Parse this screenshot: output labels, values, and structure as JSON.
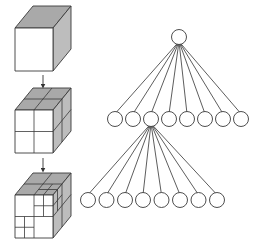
{
  "diagram": {
    "colors": {
      "stroke": "#3a3a3a",
      "front_face": "#ffffff",
      "top_face": "#a9a9a9",
      "side_face": "#bdbdbd",
      "node_fill": "#ffffff",
      "edge": "#333333",
      "background": "#ffffff"
    },
    "cubes": [
      {
        "level": 0,
        "label": "root cube",
        "front": {
          "x": 15,
          "y": 28,
          "w": 38,
          "h": 43
        },
        "depth": {
          "dx": 18,
          "dy": -22
        },
        "subdivision": "none"
      },
      {
        "level": 1,
        "label": "cube split into 8 octants",
        "front": {
          "x": 15,
          "y": 110,
          "w": 38,
          "h": 43
        },
        "depth": {
          "dx": 18,
          "dy": -22
        },
        "subdivision": "2x2x2"
      },
      {
        "level": 2,
        "label": "adaptively refined octree",
        "front": {
          "x": 15,
          "y": 195,
          "w": 38,
          "h": 43
        },
        "depth": {
          "dx": 18,
          "dy": -22
        },
        "subdivision": "2x2x2 with refined octants"
      }
    ],
    "arrows": [
      {
        "from": "cube-0",
        "to": "cube-1",
        "x": 43,
        "y1": 75,
        "y2": 86
      },
      {
        "from": "cube-1",
        "to": "cube-2",
        "x": 43,
        "y1": 158,
        "y2": 170
      }
    ],
    "tree": {
      "node_radius": 7.5,
      "root": {
        "x": 179,
        "y": 37
      },
      "level1": {
        "y": 119,
        "xs": [
          115,
          133,
          151,
          169,
          187,
          205,
          223,
          241
        ],
        "expanded_index": 2
      },
      "level2": {
        "y": 200,
        "xs": [
          88,
          106.5,
          125,
          143,
          161.5,
          180,
          198.5,
          217
        ]
      }
    }
  }
}
